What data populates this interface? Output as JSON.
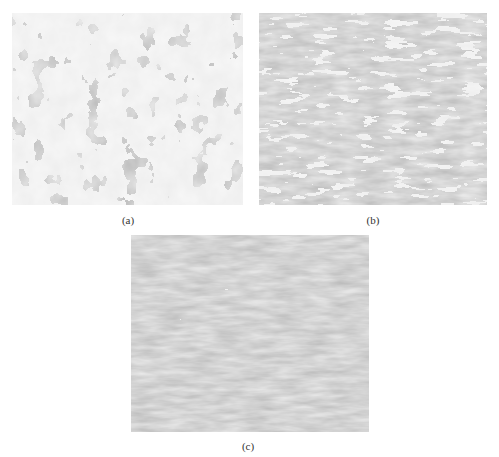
{
  "figure": {
    "panels": [
      {
        "id": "a",
        "label": "(a)",
        "description": "Coarse equiaxed grain microstructure, light ferrite grains with dark boundary phase",
        "dark_color": "#7f7f7f",
        "light_color": "#f0f0f0"
      },
      {
        "id": "b",
        "label": "(b)",
        "description": "Finer elongated banded microstructure, mixed light and dark phases",
        "dark_color": "#808080",
        "light_color": "#eeeeee"
      },
      {
        "id": "c",
        "label": "(c)",
        "description": "Fine elongated banded microstructure, predominantly dark phase with light streaks",
        "dark_color": "#7d7d7d",
        "light_color": "#ececec"
      }
    ]
  }
}
